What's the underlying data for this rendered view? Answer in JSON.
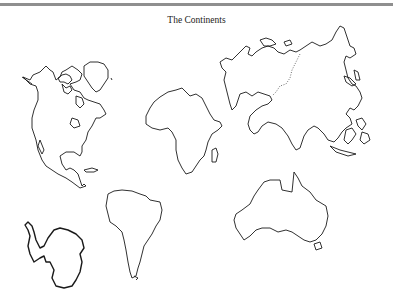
{
  "page": {
    "title": "The Continents"
  },
  "continents": [
    {
      "name": "North America",
      "icon": "north-america-outline"
    },
    {
      "name": "Greenland",
      "icon": "greenland-outline"
    },
    {
      "name": "Europe and Asia",
      "icon": "eurasia-outline"
    },
    {
      "name": "Africa",
      "icon": "africa-outline"
    },
    {
      "name": "South America",
      "icon": "south-america-outline"
    },
    {
      "name": "Antarctica",
      "icon": "antarctica-outline"
    },
    {
      "name": "Australia",
      "icon": "australia-outline"
    }
  ],
  "colors": {
    "background": "#ffffff",
    "outline": "#1a1a1a",
    "topbar": "#8f8f8f"
  }
}
